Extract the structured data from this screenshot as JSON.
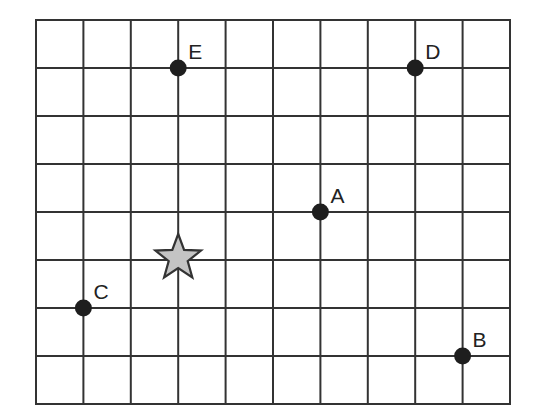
{
  "grid": {
    "columns": 10,
    "rows": 8,
    "left": 36,
    "top": 20,
    "right": 510,
    "bottom": 404,
    "line_color": "#333333"
  },
  "points": [
    {
      "label": "A",
      "col": 6,
      "row": 4
    },
    {
      "label": "B",
      "col": 9,
      "row": 7
    },
    {
      "label": "C",
      "col": 1,
      "row": 6
    },
    {
      "label": "D",
      "col": 8,
      "row": 1
    },
    {
      "label": "E",
      "col": 3,
      "row": 1
    }
  ],
  "star": {
    "col": 3,
    "row": 5,
    "fill": "#c4c4c4",
    "icon": "star-icon"
  },
  "point_color": "#1e1e1e"
}
